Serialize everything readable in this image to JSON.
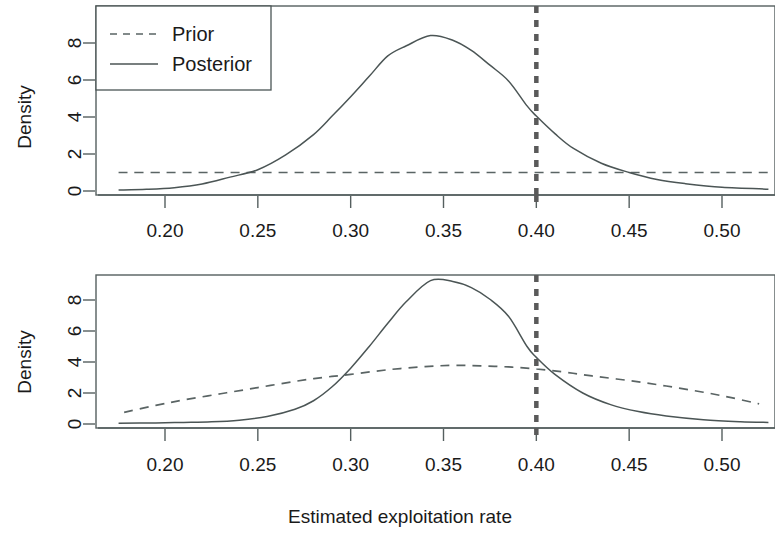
{
  "figure": {
    "xlabel": "Estimated exploitation rate",
    "ylabel_top": "Density",
    "ylabel_bottom": "Density"
  },
  "legend": {
    "prior_label": "Prior",
    "posterior_label": "Posterior",
    "prior_key": "dashed-line-icon",
    "posterior_key": "solid-line-icon"
  },
  "axes": {
    "x_ticks": [
      "0.20",
      "0.25",
      "0.30",
      "0.35",
      "0.40",
      "0.45",
      "0.50"
    ],
    "x_tick_values": [
      0.2,
      0.25,
      0.3,
      0.35,
      0.4,
      0.45,
      0.5
    ],
    "y_ticks_top": [
      "0",
      "2",
      "4",
      "6",
      "8"
    ],
    "y_tick_values_top": [
      0,
      2,
      4,
      6,
      8
    ],
    "y_ticks_bottom": [
      "0",
      "2",
      "4",
      "6",
      "8"
    ],
    "y_tick_values_bottom": [
      0,
      2,
      4,
      6,
      8
    ]
  },
  "chart_data": [
    {
      "type": "line",
      "panel": "top",
      "title": "",
      "xlabel": "",
      "ylabel": "Density",
      "xlim": [
        0.173,
        0.527
      ],
      "ylim": [
        -0.35,
        9.6
      ],
      "grid": false,
      "legend_position": "top-left",
      "annotations": [
        {
          "kind": "vline",
          "x": 0.4,
          "style": "dashed",
          "color": "#5a5a5a",
          "width": 4.5
        }
      ],
      "series": [
        {
          "name": "Prior",
          "style": "dashed",
          "color": "#5a6464",
          "x": [
            0.175,
            0.2,
            0.225,
            0.25,
            0.275,
            0.3,
            0.325,
            0.35,
            0.375,
            0.4,
            0.425,
            0.45,
            0.475,
            0.5,
            0.525
          ],
          "values": [
            1.0,
            1.0,
            1.0,
            1.0,
            1.0,
            1.0,
            1.0,
            1.0,
            1.0,
            1.0,
            1.0,
            1.0,
            1.0,
            1.0,
            1.0
          ]
        },
        {
          "name": "Posterior",
          "style": "solid",
          "color": "#4b5555",
          "x": [
            0.175,
            0.19,
            0.205,
            0.22,
            0.235,
            0.25,
            0.265,
            0.28,
            0.29,
            0.3,
            0.31,
            0.32,
            0.33,
            0.343,
            0.355,
            0.365,
            0.375,
            0.385,
            0.395,
            0.4,
            0.41,
            0.42,
            0.435,
            0.45,
            0.465,
            0.48,
            0.5,
            0.525
          ],
          "values": [
            0.05,
            0.09,
            0.18,
            0.38,
            0.75,
            1.15,
            1.95,
            3.05,
            4.05,
            5.1,
            6.2,
            7.3,
            7.85,
            8.4,
            8.15,
            7.6,
            6.8,
            5.95,
            4.6,
            4.05,
            3.1,
            2.3,
            1.5,
            1.0,
            0.62,
            0.4,
            0.2,
            0.1
          ]
        }
      ]
    },
    {
      "type": "line",
      "panel": "bottom",
      "title": "",
      "xlabel": "Estimated exploitation rate",
      "ylabel": "Density",
      "xlim": [
        0.173,
        0.527
      ],
      "ylim": [
        -0.35,
        9.9
      ],
      "grid": false,
      "legend_position": "none",
      "annotations": [
        {
          "kind": "vline",
          "x": 0.4,
          "style": "dashed",
          "color": "#5a5a5a",
          "width": 4.5
        }
      ],
      "series": [
        {
          "name": "Prior",
          "style": "dashed",
          "color": "#5a6464",
          "x": [
            0.178,
            0.195,
            0.21,
            0.23,
            0.25,
            0.27,
            0.285,
            0.3,
            0.32,
            0.34,
            0.355,
            0.37,
            0.385,
            0.4,
            0.415,
            0.43,
            0.45,
            0.47,
            0.49,
            0.505,
            0.52
          ],
          "values": [
            0.75,
            1.2,
            1.55,
            1.95,
            2.35,
            2.75,
            3.0,
            3.2,
            3.5,
            3.7,
            3.78,
            3.75,
            3.68,
            3.55,
            3.35,
            3.1,
            2.8,
            2.45,
            2.05,
            1.7,
            1.3
          ]
        },
        {
          "name": "Posterior",
          "style": "solid",
          "color": "#4b5555",
          "x": [
            0.175,
            0.195,
            0.21,
            0.225,
            0.24,
            0.255,
            0.27,
            0.28,
            0.29,
            0.3,
            0.31,
            0.32,
            0.33,
            0.343,
            0.355,
            0.365,
            0.375,
            0.385,
            0.395,
            0.4,
            0.41,
            0.425,
            0.44,
            0.455,
            0.47,
            0.49,
            0.51,
            0.525
          ],
          "values": [
            0.05,
            0.07,
            0.1,
            0.14,
            0.25,
            0.48,
            0.95,
            1.5,
            2.4,
            3.6,
            5.0,
            6.5,
            7.9,
            9.25,
            9.2,
            8.8,
            8.05,
            6.95,
            5.0,
            4.3,
            3.2,
            2.0,
            1.25,
            0.8,
            0.52,
            0.28,
            0.15,
            0.1
          ]
        }
      ]
    }
  ]
}
